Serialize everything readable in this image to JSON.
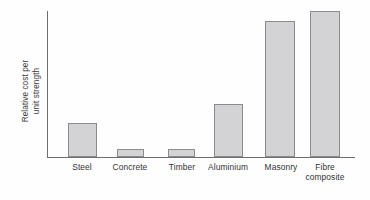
{
  "chart_data": {
    "type": "bar",
    "title": "",
    "subtitle": "",
    "xlabel": "",
    "ylabel": "Relative cost per unit strength",
    "ylabel_lines": [
      "Relative cost per",
      "unit strength"
    ],
    "categories": [
      "Steel",
      "Concrete",
      "Timber",
      "Aluminium",
      "Masonry",
      "Fibre composite"
    ],
    "category_lines": [
      [
        "Steel"
      ],
      [
        "Concrete"
      ],
      [
        "Timber"
      ],
      [
        "Aluminium"
      ],
      [
        "Masonry"
      ],
      [
        "Fibre",
        "composite"
      ]
    ],
    "values": [
      23,
      5.5,
      5.5,
      36,
      93,
      100
    ],
    "ylim": [
      0,
      100
    ],
    "xlim": [
      0,
      6
    ],
    "grid": false,
    "legend": null,
    "y_tick_labels": [],
    "x_tick_labels": [
      "Steel",
      "Concrete",
      "Timber",
      "Aluminium",
      "Masonry",
      "Fibre composite"
    ],
    "annotations": [],
    "bar_fill_color": "#d3d3d6",
    "bar_border_color": "#8b8b8e",
    "axis_color": "#6e6e70",
    "background_color": "#fefefe",
    "text_color": "#333333"
  },
  "layout": {
    "bars": [
      {
        "name": "Steel",
        "left_pct": 6.5,
        "width_pct": 9.4,
        "height_pct": 23.0
      },
      {
        "name": "Concrete",
        "left_pct": 22.5,
        "width_pct": 8.8,
        "height_pct": 5.5
      },
      {
        "name": "Timber",
        "left_pct": 39.1,
        "width_pct": 8.8,
        "height_pct": 5.5
      },
      {
        "name": "Aluminium",
        "left_pct": 54.1,
        "width_pct": 9.4,
        "height_pct": 36.0
      },
      {
        "name": "Masonry",
        "left_pct": 70.7,
        "width_pct": 9.8,
        "height_pct": 93.0
      },
      {
        "name": "Fibre composite",
        "left_pct": 85.3,
        "width_pct": 9.8,
        "height_pct": 100.0
      }
    ],
    "label_centers_px": [
      82,
      130,
      182,
      228,
      281,
      325
    ]
  }
}
